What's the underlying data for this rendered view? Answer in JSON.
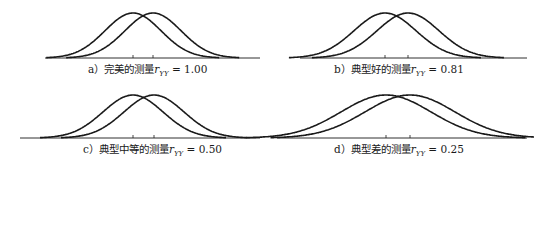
{
  "chart_data": [
    {
      "type": "line",
      "id": "a",
      "title": "a）完美的测量 r_YY = 1.00",
      "caption_prefix": "a）完美的测量",
      "symbol": "r",
      "subscript": "YY",
      "value_text": "= 1.00",
      "reliability": 1.0,
      "series": [
        {
          "name": "distribution-1",
          "mean": -0.5,
          "sd": 1.0
        },
        {
          "name": "distribution-2",
          "mean": 0.5,
          "sd": 1.0
        }
      ],
      "grid": false,
      "legend": "none"
    },
    {
      "type": "line",
      "id": "b",
      "title": "b）典型好的测量 r_YY = 0.81",
      "caption_prefix": "b）典型好的测量",
      "symbol": "r",
      "subscript": "YY",
      "value_text": "= 0.81",
      "reliability": 0.81,
      "series": [
        {
          "name": "distribution-1",
          "mean": -0.5,
          "sd": 1.11
        },
        {
          "name": "distribution-2",
          "mean": 0.5,
          "sd": 1.11
        }
      ],
      "grid": false,
      "legend": "none"
    },
    {
      "type": "line",
      "id": "c",
      "title": "c）典型中等的测量 r_YY = 0.50",
      "caption_prefix": "c）典型中等的测量",
      "symbol": "r",
      "subscript": "YY",
      "value_text": "= 0.50",
      "reliability": 0.5,
      "series": [
        {
          "name": "distribution-1",
          "mean": -0.5,
          "sd": 1.41
        },
        {
          "name": "distribution-2",
          "mean": 0.5,
          "sd": 1.41
        }
      ],
      "grid": false,
      "legend": "none"
    },
    {
      "type": "line",
      "id": "d",
      "title": "d）典型差的测量 r_YY = 0.25",
      "caption_prefix": "d）典型差的测量",
      "symbol": "r",
      "subscript": "YY",
      "value_text": "= 0.25",
      "reliability": 0.25,
      "series": [
        {
          "name": "distribution-1",
          "mean": -0.5,
          "sd": 2.0
        },
        {
          "name": "distribution-2",
          "mean": 0.5,
          "sd": 2.0
        }
      ],
      "grid": false,
      "legend": "none"
    }
  ],
  "layout": {
    "line_color": "#1a1a1a",
    "panels": [
      {
        "x": 45,
        "y": 8,
        "w": 215,
        "h": 50,
        "axis_x0": 45,
        "axis_x1": 260,
        "mean1_px": 133,
        "mean2_px": 153,
        "peak_h": 45,
        "spread_px": 28
      },
      {
        "x": 300,
        "y": 8,
        "w": 225,
        "h": 50,
        "axis_x0": 300,
        "axis_x1": 527,
        "mean1_px": 385,
        "mean2_px": 408,
        "peak_h": 45,
        "spread_px": 31
      },
      {
        "x": 20,
        "y": 88,
        "w": 240,
        "h": 50,
        "axis_x0": 20,
        "axis_x1": 260,
        "mean1_px": 133,
        "mean2_px": 154,
        "peak_h": 43,
        "spread_px": 30
      },
      {
        "x": 277,
        "y": 88,
        "w": 250,
        "h": 50,
        "axis_x0": 277,
        "axis_x1": 527,
        "mean1_px": 386,
        "mean2_px": 410,
        "peak_h": 43,
        "spread_px": 45
      }
    ],
    "captions": [
      {
        "x": 88,
        "y": 63
      },
      {
        "x": 334,
        "y": 63
      },
      {
        "x": 83,
        "y": 143
      },
      {
        "x": 334,
        "y": 143
      }
    ]
  }
}
